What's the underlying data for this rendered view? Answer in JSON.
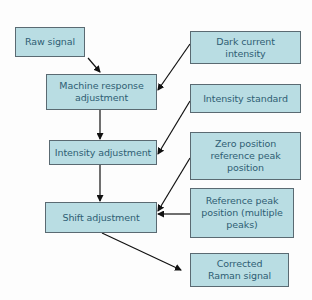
{
  "diagram": {
    "title": "",
    "colors": {
      "box_fill": "#b9dde3",
      "box_border": "#5a6a72",
      "text": "#2f5d73",
      "arrow": "#111111",
      "background": "#fdfdfd"
    },
    "nodes": {
      "raw_signal": {
        "label": "Raw signal"
      },
      "machine_response": {
        "label": "Machine response adjustment"
      },
      "intensity_adjustment": {
        "label": "Intensity adjustment"
      },
      "shift_adjustment": {
        "label": "Shift adjustment"
      },
      "dark_current": {
        "label": "Dark current intensity"
      },
      "intensity_standard": {
        "label": "Intensity standard"
      },
      "zero_position": {
        "label": "Zero position reference peak position"
      },
      "reference_peak": {
        "label": "Reference peak position (multiple peaks)"
      },
      "corrected_raman": {
        "label": "Corrected Raman signal"
      }
    },
    "edges": [
      {
        "from": "Raw signal",
        "to": "Machine response adjustment"
      },
      {
        "from": "Dark current intensity",
        "to": "Machine response adjustment"
      },
      {
        "from": "Machine response adjustment",
        "to": "Intensity adjustment"
      },
      {
        "from": "Intensity standard",
        "to": "Intensity adjustment"
      },
      {
        "from": "Intensity adjustment",
        "to": "Shift adjustment"
      },
      {
        "from": "Zero position reference peak position",
        "to": "Shift adjustment"
      },
      {
        "from": "Reference peak position (multiple peaks)",
        "to": "Shift adjustment"
      },
      {
        "from": "Shift adjustment",
        "to": "Corrected Raman signal"
      }
    ]
  }
}
